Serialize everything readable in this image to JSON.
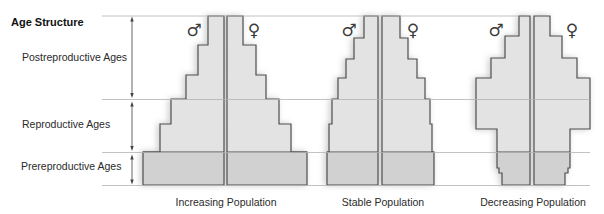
{
  "title": "Age Structure",
  "age_groups": [
    {
      "label": "Postreproductive Ages"
    },
    {
      "label": "Reproductive Ages"
    },
    {
      "label": "Prereproductive Ages"
    }
  ],
  "symbols": {
    "male": "♂",
    "female": "♀"
  },
  "colors": {
    "light": "#e3e3e3",
    "dark": "#d1d1d1",
    "outline": "#4e4e4e",
    "gridline": "#b3b3b3"
  },
  "pyramids": [
    {
      "id": "increasing",
      "label": "Increasing Population",
      "left_center": 224,
      "right_center": 227,
      "rows": [
        {
          "y0": 16,
          "y1": 45,
          "left": 208,
          "right": 243,
          "tone": "light"
        },
        {
          "y0": 45,
          "y1": 75,
          "left": 198,
          "right": 256,
          "tone": "light"
        },
        {
          "y0": 75,
          "y1": 99,
          "left": 186,
          "right": 266,
          "tone": "light"
        },
        {
          "y0": 99,
          "y1": 124,
          "left": 171,
          "right": 279,
          "tone": "light"
        },
        {
          "y0": 124,
          "y1": 152,
          "left": 160,
          "right": 291,
          "tone": "light"
        },
        {
          "y0": 152,
          "y1": 185,
          "left": 143,
          "right": 307,
          "tone": "dark"
        }
      ]
    },
    {
      "id": "stable",
      "label": "Stable Population",
      "left_center": 378,
      "right_center": 382,
      "rows": [
        {
          "y0": 16,
          "y1": 38,
          "left": 364,
          "right": 400,
          "tone": "light"
        },
        {
          "y0": 38,
          "y1": 59,
          "left": 354,
          "right": 408,
          "tone": "light"
        },
        {
          "y0": 59,
          "y1": 78,
          "left": 346,
          "right": 417,
          "tone": "light"
        },
        {
          "y0": 78,
          "y1": 99,
          "left": 338,
          "right": 425,
          "tone": "light"
        },
        {
          "y0": 99,
          "y1": 124,
          "left": 332,
          "right": 430,
          "tone": "light"
        },
        {
          "y0": 124,
          "y1": 152,
          "left": 329,
          "right": 432,
          "tone": "light"
        },
        {
          "y0": 152,
          "y1": 185,
          "left": 327,
          "right": 434,
          "tone": "dark"
        }
      ]
    },
    {
      "id": "decreasing",
      "label": "Decreasing Population",
      "left_center": 530,
      "right_center": 534,
      "rows": [
        {
          "y0": 16,
          "y1": 36,
          "left": 519,
          "right": 550,
          "tone": "light"
        },
        {
          "y0": 36,
          "y1": 58,
          "left": 505,
          "right": 562,
          "tone": "light"
        },
        {
          "y0": 58,
          "y1": 78,
          "left": 491,
          "right": 577,
          "tone": "light"
        },
        {
          "y0": 78,
          "y1": 129,
          "left": 476,
          "right": 590,
          "tone": "light"
        },
        {
          "y0": 129,
          "y1": 152,
          "left": 497,
          "right": 570,
          "tone": "light"
        },
        {
          "y0": 152,
          "y1": 168,
          "left": 497,
          "right": 570,
          "tone": "dark"
        },
        {
          "y0": 168,
          "y1": 173,
          "left": 499,
          "right": 568,
          "tone": "dark"
        },
        {
          "y0": 173,
          "y1": 185,
          "left": 502,
          "right": 565,
          "tone": "dark"
        }
      ]
    }
  ]
}
